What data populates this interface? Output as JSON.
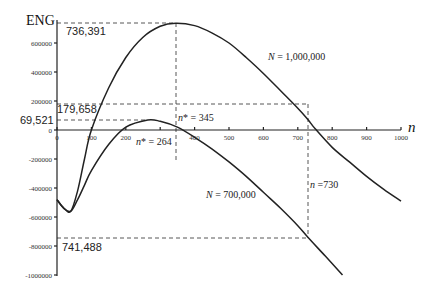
{
  "chart_data": {
    "type": "line",
    "title": "",
    "xlabel": "n",
    "ylabel": "ENG",
    "xlim": [
      0,
      1000
    ],
    "ylim": [
      -1000000,
      750000
    ],
    "grid": false,
    "x_ticks": [
      0,
      100,
      200,
      300,
      400,
      500,
      600,
      700,
      800,
      900,
      1000
    ],
    "x_tick_labels": [
      "0",
      "100",
      "200",
      "",
      "400",
      "500",
      "600",
      "700",
      "800",
      "900",
      "1000"
    ],
    "y_ticks": [
      600000,
      400000,
      200000,
      0,
      -200000,
      -400000,
      -600000,
      -800000,
      -1000000
    ],
    "y_tick_labels": [
      "600000",
      "400000",
      "200000",
      "0",
      "-200000",
      "-400000",
      "-600000",
      "-800000",
      "-1000000"
    ],
    "series": [
      {
        "name": "N = 1,000,000",
        "x": [
          0,
          20,
          40,
          60,
          80,
          100,
          150,
          200,
          250,
          300,
          345,
          400,
          450,
          500,
          550,
          600,
          650,
          700,
          730,
          750,
          800,
          850,
          900,
          950,
          1000
        ],
        "y": [
          -480000,
          -540000,
          -560000,
          -420000,
          -200000,
          0,
          290000,
          500000,
          640000,
          715000,
          736391,
          720000,
          670000,
          600000,
          500000,
          390000,
          270000,
          150000,
          70000,
          10000,
          -120000,
          -220000,
          -320000,
          -410000,
          -490000
        ]
      },
      {
        "name": "N = 700,000",
        "x": [
          0,
          20,
          40,
          60,
          80,
          100,
          150,
          200,
          264,
          300,
          350,
          400,
          450,
          500,
          550,
          600,
          650,
          700,
          730,
          780,
          830
        ],
        "y": [
          -480000,
          -540000,
          -560000,
          -480000,
          -380000,
          -280000,
          -100000,
          20000,
          69521,
          60000,
          20000,
          -50000,
          -130000,
          -220000,
          -320000,
          -430000,
          -540000,
          -660000,
          -741488,
          -870000,
          -1000000
        ]
      }
    ],
    "annotations": [
      {
        "text": "736,391",
        "type": "y-value",
        "series": "N = 1,000,000",
        "x": 345,
        "y": 736391
      },
      {
        "text": "179,658",
        "type": "y-value",
        "series": "N = 1,000,000",
        "x": 730,
        "y": 179658
      },
      {
        "text": "69,521",
        "type": "y-value",
        "series": "N = 700,000",
        "x": 264,
        "y": 69521
      },
      {
        "text": "-741,488",
        "type": "y-value",
        "series": "N = 700,000",
        "x": 730,
        "y": -741488
      },
      {
        "text": "n* = 345",
        "type": "x-value",
        "x": 345
      },
      {
        "text": "n* = 264",
        "type": "x-value",
        "x": 264
      },
      {
        "text": "n =730",
        "type": "x-value",
        "x": 730
      }
    ],
    "series_labels": [
      {
        "text": "N = 1,000,000",
        "italic_part": "N"
      },
      {
        "text": "N = 700,000",
        "italic_part": "N"
      }
    ]
  },
  "labels": {
    "y_axis_title": "ENG",
    "x_axis_title": "n",
    "peak_1m": "736,391",
    "val_1m_730": "179,658",
    "peak_700k": "69,521",
    "val_700k_730": "741,488",
    "nstar_345_prefix": "n",
    "nstar_345_suffix": "* = 345",
    "nstar_264_prefix": "n",
    "nstar_264_suffix": "* = 264",
    "n730_prefix": "n",
    "n730_suffix": " =730",
    "series_1m_prefix": "N",
    "series_1m_suffix": " = 1,000,000",
    "series_700k_prefix": "N",
    "series_700k_suffix": " = 700,000"
  }
}
